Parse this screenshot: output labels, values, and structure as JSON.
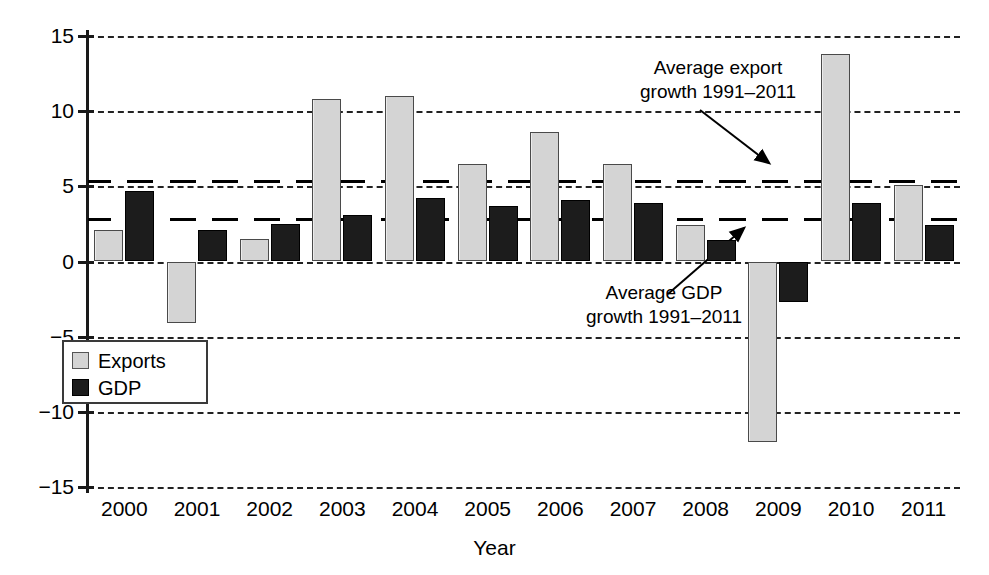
{
  "chart_data": {
    "type": "bar",
    "title": "",
    "xlabel": "Year",
    "ylabel": "",
    "categories": [
      "2000",
      "2001",
      "2002",
      "2003",
      "2004",
      "2005",
      "2006",
      "2007",
      "2008",
      "2009",
      "2010",
      "2011"
    ],
    "series": [
      {
        "name": "Exports",
        "color": "#d4d4d4",
        "values": [
          2.1,
          -4.1,
          1.5,
          10.8,
          11.0,
          6.5,
          8.6,
          6.5,
          2.4,
          -12.0,
          13.8,
          5.1
        ]
      },
      {
        "name": "GDP",
        "color": "#1c1c1c",
        "values": [
          4.7,
          2.1,
          2.5,
          3.1,
          4.2,
          3.7,
          4.1,
          3.9,
          1.4,
          -2.7,
          3.9,
          2.4
        ]
      }
    ],
    "ylim": [
      -15,
      15
    ],
    "yticks": [
      15,
      10,
      5,
      0,
      -5,
      -10,
      -15
    ],
    "ytick_labels": [
      "15",
      "10",
      "5",
      "0",
      "−5",
      "−10",
      "−15"
    ],
    "grid": true,
    "legend_position": "inner-left",
    "reference_lines": [
      {
        "name": "Average export growth 1991-2011",
        "value": 5.4
      },
      {
        "name": "Average GDP growth 1991-2011",
        "value": 2.9
      }
    ],
    "annotations": [
      {
        "id": "export-avg",
        "text": "Average export\ngrowth 1991–2011",
        "target_value": 5.4
      },
      {
        "id": "gdp-avg",
        "text": "Average GDP\ngrowth 1991–2011",
        "target_value": 2.9
      }
    ]
  }
}
